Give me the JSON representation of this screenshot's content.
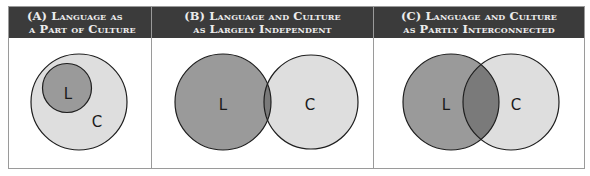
{
  "figure": {
    "colors": {
      "header_bg": "#3b3b3b",
      "header_text": "#ececec",
      "language_fill": "#9a9a9a",
      "culture_fill": "#dedede",
      "overlap_fill": "#7a7a7a",
      "outline": "#1e1e1e",
      "frame_border": "#9a9a9a"
    },
    "panels": [
      {
        "id": "A",
        "title_line1": "(A) Language as",
        "title_line2": "a Part of Culture",
        "language_label": "L",
        "culture_label": "C",
        "relationship": "language-inside-culture"
      },
      {
        "id": "B",
        "title_line1": "(B) Language and Culture",
        "title_line2": "as Largely Independent",
        "language_label": "L",
        "culture_label": "C",
        "relationship": "minimal-overlap"
      },
      {
        "id": "C",
        "title_line1": "(C) Language and Culture",
        "title_line2": "as Partly Interconnected",
        "language_label": "L",
        "culture_label": "C",
        "relationship": "partial-overlap"
      }
    ]
  }
}
